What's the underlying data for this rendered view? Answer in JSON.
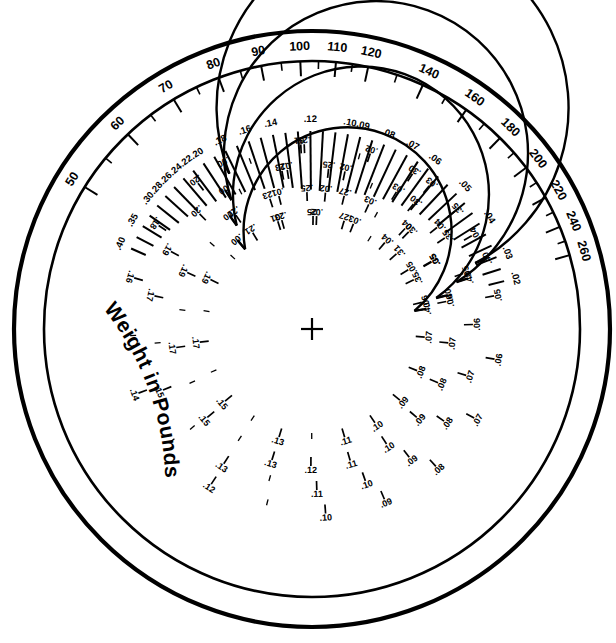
{
  "page": {
    "background_color": "#ffffff",
    "ink_color": "#000000",
    "width": 616,
    "height": 643,
    "header_faint_text": ""
  },
  "geometry": {
    "center_x": 312,
    "center_y": 329,
    "outer_ring_radius": 298,
    "inner_ring_radius": 268,
    "weight_scale_radius": 253,
    "ray_scale_outer_radius": 198,
    "arc_radii": [
      104,
      128,
      152,
      176
    ],
    "crosshair_size": 11
  },
  "chart_data": {
    "type": "nomogram",
    "title": "Weight in Pounds",
    "scales": [
      {
        "name": "weight-in-pounds-scale",
        "label": "Weight in Pounds",
        "kind": "outer-ring",
        "units": "pounds",
        "range": [
          50,
          260
        ],
        "angle_start_deg": -148,
        "angle_end_deg": -16,
        "major_labels": [
          50,
          60,
          70,
          80,
          90,
          100,
          110,
          120,
          140,
          160,
          180,
          200,
          220,
          240,
          260
        ],
        "major_values": [
          50,
          60,
          70,
          80,
          90,
          100,
          110,
          120,
          130,
          140,
          150,
          160,
          170,
          180,
          190,
          200,
          210,
          220,
          230,
          240,
          250,
          260
        ],
        "minor_step": 5,
        "label_position": "outside-arc",
        "tick_direction": "inward"
      },
      {
        "name": "ray-scale",
        "kind": "radial-rays",
        "angle_start_deg": -156,
        "angle_end_deg": -14,
        "labeled_values": [
          ".40",
          ".35",
          ".30",
          ".28",
          ".26",
          ".24",
          ".22",
          ".20",
          ".18",
          ".16",
          ".14",
          ".12",
          ".10",
          ".09",
          ".08",
          ".07",
          ".06",
          ".05",
          ".04",
          ".03",
          ".02"
        ],
        "unlabeled_intermediate_rays": true,
        "total_rays": 40,
        "label_position": "outer-end-of-ray"
      },
      {
        "name": "arc-scale-1",
        "kind": "arc",
        "ring_index": 1,
        "radius": 176,
        "angle_start_deg": -118,
        "angle_end_deg": -22,
        "start_label": ".00",
        "end_label": ".40",
        "labels": [
          ".00",
          ".01",
          ".02",
          ".03",
          ".04",
          ".05",
          ".06",
          ".07",
          ".08",
          ".09",
          ".10",
          ".12",
          ".14",
          ".16",
          ".18",
          ".20",
          ".25",
          ".30",
          ".35",
          ".40"
        ]
      },
      {
        "name": "arc-scale-2",
        "kind": "arc",
        "ring_index": 2,
        "radius": 152,
        "angle_start_deg": -122,
        "angle_end_deg": -18,
        "start_label": ".00",
        "end_label": ".40",
        "labels": [
          ".00",
          ".01",
          ".02",
          ".03",
          ".04",
          ".05",
          ".06",
          ".07",
          ".08",
          ".09",
          ".10",
          ".11",
          ".13",
          ".15",
          ".17",
          ".19",
          ".20",
          ".23",
          ".25",
          ".30",
          ".35",
          ".40"
        ]
      },
      {
        "name": "arc-scale-3",
        "kind": "arc",
        "ring_index": 3,
        "radius": 128,
        "angle_start_deg": -126,
        "angle_end_deg": -14,
        "start_label": ".00",
        "end_label": ".40",
        "labels": [
          ".00",
          ".01",
          ".02",
          ".03",
          ".04",
          ".05",
          ".06",
          ".07",
          ".08",
          ".09",
          ".10",
          ".11",
          ".12",
          ".13",
          ".15",
          ".17",
          ".19",
          ".21",
          ".23",
          ".25",
          ".27",
          ".30",
          ".35",
          ".40"
        ]
      },
      {
        "name": "arc-scale-4",
        "kind": "arc",
        "ring_index": 4,
        "radius": 104,
        "angle_start_deg": -130,
        "angle_end_deg": -10,
        "start_label": ".00",
        "end_label": ".40",
        "labels": [
          ".00",
          ".01",
          ".02",
          ".03",
          ".04",
          ".05",
          ".06",
          ".07",
          ".08",
          ".09",
          ".10",
          ".11",
          ".13",
          ".15",
          ".17",
          ".19",
          ".21",
          ".23",
          ".25",
          ".27",
          ".31",
          ".35",
          ".40"
        ]
      }
    ],
    "weight_ticks": [
      {
        "value": 50,
        "label": "50",
        "major": true
      },
      {
        "value": 55,
        "label": "",
        "major": false
      },
      {
        "value": 60,
        "label": "60",
        "major": true
      },
      {
        "value": 65,
        "label": "",
        "major": false
      },
      {
        "value": 70,
        "label": "70",
        "major": true
      },
      {
        "value": 75,
        "label": "",
        "major": false
      },
      {
        "value": 80,
        "label": "80",
        "major": true
      },
      {
        "value": 85,
        "label": "",
        "major": false
      },
      {
        "value": 90,
        "label": "90",
        "major": true
      },
      {
        "value": 95,
        "label": "",
        "major": false
      },
      {
        "value": 100,
        "label": "100",
        "major": true
      },
      {
        "value": 105,
        "label": "",
        "major": false
      },
      {
        "value": 110,
        "label": "110",
        "major": true
      },
      {
        "value": 115,
        "label": "",
        "major": false
      },
      {
        "value": 120,
        "label": "120",
        "major": true
      },
      {
        "value": 130,
        "label": "",
        "major": false
      },
      {
        "value": 140,
        "label": "140",
        "major": true
      },
      {
        "value": 150,
        "label": "",
        "major": false
      },
      {
        "value": 160,
        "label": "160",
        "major": true
      },
      {
        "value": 170,
        "label": "",
        "major": false
      },
      {
        "value": 180,
        "label": "180",
        "major": true
      },
      {
        "value": 190,
        "label": "",
        "major": false
      },
      {
        "value": 200,
        "label": "200",
        "major": true
      },
      {
        "value": 210,
        "label": "",
        "major": false
      },
      {
        "value": 220,
        "label": "220",
        "major": true
      },
      {
        "value": 230,
        "label": "",
        "major": false
      },
      {
        "value": 240,
        "label": "240",
        "major": true
      },
      {
        "value": 250,
        "label": "",
        "major": false
      },
      {
        "value": 260,
        "label": "260",
        "major": true
      }
    ],
    "ray_scale_entries": [
      {
        "label": ".40",
        "labeled": true
      },
      {
        "label": "",
        "labeled": false
      },
      {
        "label": ".35",
        "labeled": true
      },
      {
        "label": "",
        "labeled": false
      },
      {
        "label": ".30",
        "labeled": true
      },
      {
        "label": ".28",
        "labeled": true
      },
      {
        "label": ".26",
        "labeled": true
      },
      {
        "label": ".24",
        "labeled": true
      },
      {
        "label": ".22",
        "labeled": true
      },
      {
        "label": ".20",
        "labeled": true
      },
      {
        "label": "",
        "labeled": false
      },
      {
        "label": ".18",
        "labeled": true
      },
      {
        "label": "",
        "labeled": false
      },
      {
        "label": ".16",
        "labeled": true
      },
      {
        "label": "",
        "labeled": false
      },
      {
        "label": ".14",
        "labeled": true
      },
      {
        "label": "",
        "labeled": false
      },
      {
        "label": "",
        "labeled": false
      },
      {
        "label": ".12",
        "labeled": true
      },
      {
        "label": "",
        "labeled": false
      },
      {
        "label": "",
        "labeled": false
      },
      {
        "label": ".10",
        "labeled": true
      },
      {
        "label": ".09",
        "labeled": true
      },
      {
        "label": "",
        "labeled": false
      },
      {
        "label": ".08",
        "labeled": true
      },
      {
        "label": "",
        "labeled": false
      },
      {
        "label": ".07",
        "labeled": true
      },
      {
        "label": "",
        "labeled": false
      },
      {
        "label": ".06",
        "labeled": true
      },
      {
        "label": "",
        "labeled": false
      },
      {
        "label": "",
        "labeled": false
      },
      {
        "label": ".05",
        "labeled": true
      },
      {
        "label": "",
        "labeled": false
      },
      {
        "label": "",
        "labeled": false
      },
      {
        "label": ".04",
        "labeled": true
      },
      {
        "label": "",
        "labeled": false
      },
      {
        "label": "",
        "labeled": false
      },
      {
        "label": ".03",
        "labeled": true
      },
      {
        "label": "",
        "labeled": false
      },
      {
        "label": ".02",
        "labeled": true
      }
    ],
    "arc_tick_labels": {
      "arc1": [
        ".00",
        ".01",
        ".02",
        ".03",
        ".04",
        ".05",
        ".06",
        ".07",
        ".08",
        ".09",
        ".10",
        "",
        ".12",
        "",
        ".14",
        "",
        ".16",
        ".18",
        ".20",
        "",
        ".25",
        "",
        ".30",
        ".35",
        ".40"
      ],
      "arc2": [
        ".00",
        ".01",
        ".02",
        ".03",
        ".04",
        ".05",
        ".06",
        ".07",
        ".08",
        ".09",
        ".10",
        ".11",
        "",
        ".13",
        "",
        ".15",
        "",
        ".17",
        ".19",
        ".20",
        "",
        ".23",
        ".25",
        "",
        ".30",
        ".35",
        ".40"
      ],
      "arc3": [
        ".00",
        ".01",
        ".02",
        ".03",
        ".04",
        ".05",
        ".06",
        ".07",
        ".08",
        ".09",
        ".10",
        ".11",
        ".12",
        ".13",
        "",
        ".15",
        "",
        ".17",
        "",
        ".19",
        "",
        ".21",
        ".23",
        ".25",
        ".27",
        "",
        ".30",
        ".35",
        ".40"
      ],
      "arc4": [
        ".00",
        ".01",
        ".02",
        ".03",
        ".04",
        ".05",
        ".06",
        ".07",
        ".08",
        ".09",
        ".10",
        ".11",
        "",
        ".13",
        "",
        ".15",
        "",
        ".17",
        "",
        ".19",
        "",
        ".21",
        ".23",
        ".25",
        ".27",
        "",
        ".31",
        ".35",
        ".40"
      ]
    },
    "center_marker": {
      "name": "center-crosshair",
      "symbol": "+"
    }
  }
}
